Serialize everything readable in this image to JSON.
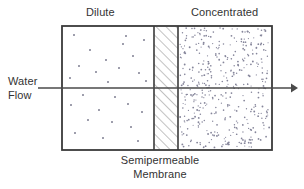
{
  "diagram": {
    "title_left": "Dilute",
    "title_right": "Concentrated",
    "flow_label_line1": "Water",
    "flow_label_line2": "Flow",
    "membrane_label_line1": "Semipermeable",
    "membrane_label_line2": "Membrane",
    "colors": {
      "outline": "#3a3a3a",
      "text": "#333333",
      "dot": "#7a7a8a",
      "hatch": "#8a8a8a",
      "arrow": "#4a4a4a",
      "background": "#ffffff"
    },
    "regions": {
      "dilute": {
        "name": "dilute-solution-region",
        "solute_density": "sparse",
        "dot_count": 26
      },
      "membrane": {
        "name": "semipermeable-membrane-band",
        "fill": "diagonal-hatch"
      },
      "concentrated": {
        "name": "concentrated-solution-region",
        "solute_density": "dense",
        "dot_count": 420
      }
    },
    "arrow": {
      "name": "water-flow-arrow",
      "direction": "left-to-right",
      "from_x": 38,
      "to_x": 296,
      "y": 88
    },
    "box": {
      "left": 62,
      "top": 26,
      "right": 272,
      "bottom": 150
    }
  }
}
